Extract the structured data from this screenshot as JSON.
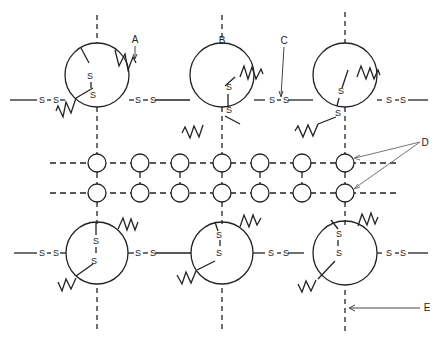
{
  "labels": {
    "A": "A",
    "B": "B",
    "C": "C",
    "D": "D",
    "E": "E"
  },
  "bond": {
    "sulfur": "S"
  },
  "colors": {
    "ink": "#222222",
    "pointer": "#555555",
    "background": "#ffffff"
  },
  "layout": {
    "top_subunits": [
      {
        "cx": 97,
        "cy": 75,
        "r": 32
      },
      {
        "cx": 222,
        "cy": 75,
        "r": 32
      },
      {
        "cx": 345,
        "cy": 75,
        "r": 32
      }
    ],
    "bottom_subunits": [
      {
        "cx": 97,
        "cy": 263,
        "r": 32
      },
      {
        "cx": 222,
        "cy": 263,
        "r": 32
      },
      {
        "cx": 345,
        "cy": 265,
        "r": 32
      }
    ],
    "bead_rows_y": [
      163,
      193
    ],
    "bead_cols_x": [
      97,
      140,
      180,
      222,
      260,
      302,
      345
    ],
    "bead_r": 9
  }
}
